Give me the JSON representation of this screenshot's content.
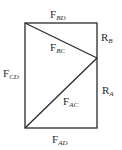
{
  "diagram": {
    "type": "truss-force-diagram",
    "nodes": {
      "top_left": [
        25,
        23
      ],
      "top_right": [
        97,
        23
      ],
      "right_mid": [
        97,
        58
      ],
      "bottom_right": [
        97,
        128
      ],
      "bottom_left": [
        25,
        128
      ]
    },
    "labels": {
      "F_BD": {
        "main": "F",
        "sub": "BD"
      },
      "F_BC": {
        "main": "F",
        "sub": "BC"
      },
      "R_B": {
        "main": "R",
        "sub": "B"
      },
      "F_CD": {
        "main": "F",
        "sub": "CD"
      },
      "F_AC": {
        "main": "F",
        "sub": "AC"
      },
      "R_A": {
        "main": "R",
        "sub": "A"
      },
      "F_AD": {
        "main": "F",
        "sub": "AD"
      }
    },
    "line_color": "#2a2a2a"
  }
}
